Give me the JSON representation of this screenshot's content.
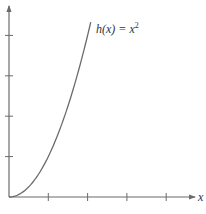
{
  "chart_data": {
    "type": "line",
    "title": "",
    "function_label": "h(x) = x²",
    "label_parts": {
      "name": "h(x) = x",
      "exponent": "2"
    },
    "xlabel": "x",
    "ylabel": "",
    "x": [
      0,
      0.25,
      0.5,
      0.75,
      1.0,
      1.25,
      1.5,
      1.75,
      2.0,
      2.08
    ],
    "series": [
      {
        "name": "h(x) = x^2",
        "values": [
          0,
          0.0625,
          0.25,
          0.5625,
          1.0,
          1.5625,
          2.25,
          3.0625,
          4.0,
          4.33
        ]
      }
    ],
    "xlim": [
      0,
      4.8
    ],
    "ylim": [
      0,
      4.8
    ],
    "x_ticks": [
      1,
      2,
      3,
      4
    ],
    "y_ticks": [
      1,
      2,
      3,
      4
    ],
    "tick_labels_shown": false,
    "grid": false,
    "legend": "none",
    "colors": {
      "curve": "#6b6b6b",
      "axis": "#6b6b6b"
    }
  }
}
